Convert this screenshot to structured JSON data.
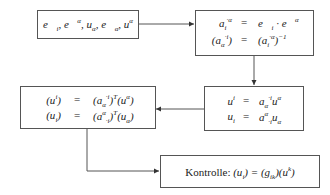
{
  "diagram": {
    "box1": {
      "text": "e⃗ᵢ, e⃗ᵅ, u_α, e⃗_α, uᵅ"
    },
    "box2": {
      "rows": [
        {
          "lhs": "aᵢ·ᵅ",
          "eq": "=",
          "rhs": "e⃗ᵢ · e⃗ᵅ"
        },
        {
          "lhs": "(a_α·ⁱ)",
          "eq": "=",
          "rhs": "(aᵢ·ᵅ)⁻¹"
        }
      ]
    },
    "box3": {
      "rows": [
        {
          "lhs": "uⁱ",
          "eq": "=",
          "rhs": "a_α·ⁱ uᵅ"
        },
        {
          "lhs": "uᵢ",
          "eq": "=",
          "rhs": "aᵅ·ᵢ u_α"
        }
      ]
    },
    "box4": {
      "rows": [
        {
          "lhs": "(uⁱ)",
          "eq": "=",
          "rhs": "(a_α·ⁱ)ᵀ(uᵅ)"
        },
        {
          "lhs": "(uᵢ)",
          "eq": "=",
          "rhs": "(aᵅ·ᵢ)ᵀ(u_α)"
        }
      ]
    },
    "box5": {
      "label": "Kontrolle:",
      "formula": "(uᵢ) = (g_ik)(uᵏ)"
    },
    "colors": {
      "line": "#555555",
      "text": "#222222",
      "background": "#ffffff"
    }
  }
}
